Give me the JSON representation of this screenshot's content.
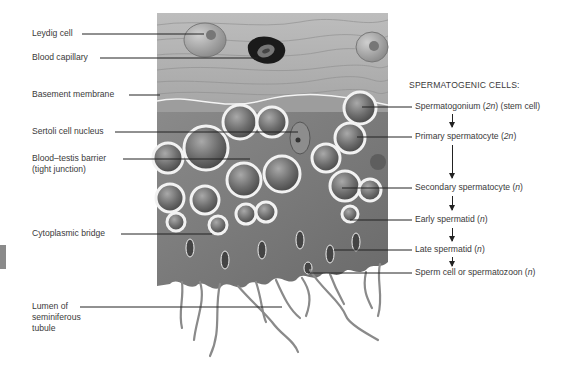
{
  "figure": {
    "left_labels": [
      {
        "id": "leydig",
        "text": "Leydig cell"
      },
      {
        "id": "capillary",
        "text": "Blood capillary"
      },
      {
        "id": "basement",
        "text": "Basement membrane"
      },
      {
        "id": "sertoli",
        "text": "Sertoli cell nucleus"
      },
      {
        "id": "btb_line1",
        "text": "Blood–testis barrier"
      },
      {
        "id": "btb_line2",
        "text": "(tight junction)"
      },
      {
        "id": "bridge",
        "text": "Cytoplasmic bridge"
      },
      {
        "id": "lumen_line1",
        "text": "Lumen of"
      },
      {
        "id": "lumen_line2",
        "text": "seminiferous"
      },
      {
        "id": "lumen_line3",
        "text": "tubule"
      }
    ],
    "right_heading": "SPERMATOGENIC CELLS:",
    "right_labels": [
      {
        "name": "Spermatogonium (",
        "ploidy": "2n",
        "suffix": ") (stem cell)"
      },
      {
        "name": "Primary spermatocyte (",
        "ploidy": "2n",
        "suffix": ")"
      },
      {
        "name": "Secondary spermatocyte (",
        "ploidy": "n",
        "suffix": ")"
      },
      {
        "name": "Early spermatid (",
        "ploidy": "n",
        "suffix": ")"
      },
      {
        "name": "Late spermatid (",
        "ploidy": "n",
        "suffix": ")"
      },
      {
        "name": "Sperm cell or spermatozoon (",
        "ploidy": "n",
        "suffix": ")"
      }
    ],
    "colors": {
      "tissue_dark": "#6e6e6e",
      "tissue_mid": "#9a9a9a",
      "connective": "#b8b8b8",
      "cell_membrane": "#f2f2f2",
      "leader_line": "#222222",
      "label_text": "#3a3a3a"
    }
  }
}
